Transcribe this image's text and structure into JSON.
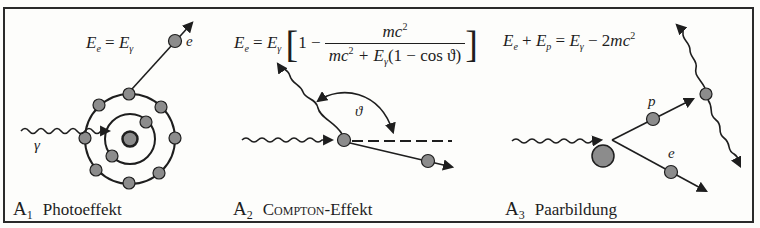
{
  "panels": [
    {
      "id": "A1",
      "label_letter": "A",
      "label_index": "1",
      "title": "Photoeffekt",
      "formula": {
        "lhs": "E",
        "lhs_sub": "e",
        "eq": "=",
        "rhs": "E",
        "rhs_sub": "γ"
      },
      "labels": {
        "photon": "γ",
        "electron": "e"
      }
    },
    {
      "id": "A2",
      "label_letter": "A",
      "label_index": "2",
      "title": "Compton",
      "title_suffix": "-Effekt",
      "formula": {
        "lhs": "E",
        "lhs_sub": "e",
        "eq": "=",
        "factor": "E",
        "factor_sub": "γ",
        "one_minus": "1 −",
        "numerator": "mc",
        "numerator_sup": "2",
        "denominator_a": "mc",
        "denominator_a_sup": "2",
        "denominator_plus": " + E",
        "denominator_sub": "γ",
        "denominator_rest": "(1 − cos ϑ)"
      },
      "labels": {
        "angle": "ϑ"
      }
    },
    {
      "id": "A3",
      "label_letter": "A",
      "label_index": "3",
      "title": "Paarbildung",
      "formula": {
        "e1": "E",
        "e1_sub": "e",
        "plus": " + ",
        "e2": "E",
        "e2_sub": "p",
        "eq": " = ",
        "e3": "E",
        "e3_sub": "γ",
        "minus": " − 2",
        "mc": "mc",
        "mc_sup": "2"
      },
      "labels": {
        "positron": "p",
        "electron": "e"
      }
    }
  ],
  "colors": {
    "particle_fill": "#8c8c8c",
    "line": "#1e1e1e",
    "border": "#2a2a2a",
    "background": "#fdfdfb"
  }
}
